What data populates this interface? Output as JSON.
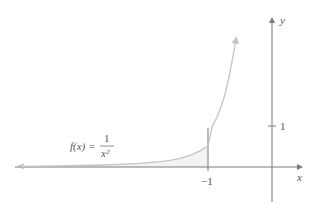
{
  "figure": {
    "function_label": {
      "lhs": "f(x) =",
      "numerator": "1",
      "denominator": "x²"
    },
    "x_axis_label": "x",
    "y_axis_label": "y",
    "x_tick_label": "−1",
    "y_tick_label": "1",
    "colors": {
      "curve": "#c4c4c4",
      "axis": "#7a7a7a",
      "shade": "#f2f2f2",
      "text": "#555555"
    }
  }
}
